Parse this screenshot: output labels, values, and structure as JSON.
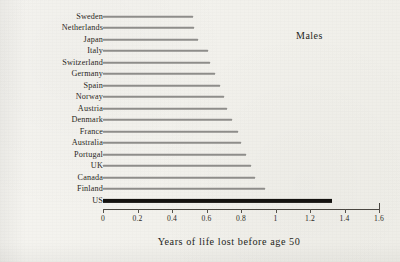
{
  "figure": {
    "annotation": "Males",
    "background_color": "#f2f1ec",
    "bar_color": "#8e8d8a",
    "highlight_color": "#14120f"
  },
  "chart_data": {
    "type": "bar",
    "orientation": "horizontal",
    "title": "",
    "subtitle": "",
    "annotation": "Males",
    "xlabel": "Years of life lost before age 50",
    "ylabel": "",
    "xlim": [
      0,
      1.6
    ],
    "xticks": [
      "0",
      "0.2",
      "0.4",
      "0.6",
      "0.8",
      "1",
      "1.2",
      "1.4",
      "1.6"
    ],
    "xtick_values": [
      0,
      0.2,
      0.4,
      0.6,
      0.8,
      1.0,
      1.2,
      1.4,
      1.6
    ],
    "grid": false,
    "legend": "none",
    "highlight_category": "US",
    "categories": [
      "Sweden",
      "Netherlands",
      "Japan",
      "Italy",
      "Switzerland",
      "Germany",
      "Spain",
      "Norway",
      "Austria",
      "Denmark",
      "France",
      "Australia",
      "Portugal",
      "UK",
      "Canada",
      "Finland",
      "US"
    ],
    "values": [
      0.52,
      0.53,
      0.55,
      0.61,
      0.62,
      0.65,
      0.68,
      0.7,
      0.72,
      0.75,
      0.78,
      0.8,
      0.83,
      0.86,
      0.88,
      0.94,
      1.33
    ]
  }
}
